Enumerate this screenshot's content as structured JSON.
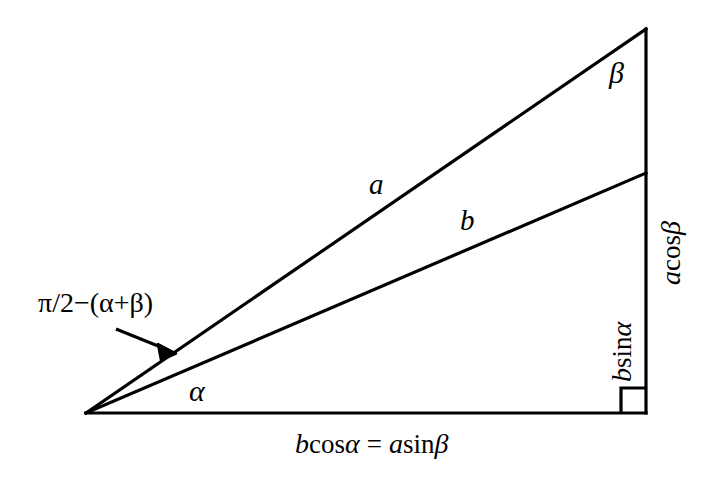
{
  "figure": {
    "background_color": "#ffffff",
    "stroke_color": "#000000",
    "width": 723,
    "height": 483
  },
  "labels": {
    "side_a": "a",
    "side_b": "b",
    "angle_alpha": "α",
    "angle_beta": "β",
    "annotation_complement": "π/2−(α+β)",
    "vertical_upper": {
      "var1": "a",
      "fn": "cos",
      "var2": "β"
    },
    "vertical_lower": {
      "var1": "b",
      "fn": "sin",
      "var2": "α"
    },
    "base_equation": {
      "lhs_var": "b",
      "lhs_fn": "cos",
      "lhs_arg": "α",
      "equals": "=",
      "rhs_var": "a",
      "rhs_fn": "sin",
      "rhs_arg": "β"
    }
  },
  "geometry": {
    "left_vertex": {
      "x": 86,
      "y": 413
    },
    "apex": {
      "x": 646,
      "y": 29
    },
    "bottom_right": {
      "x": 646,
      "y": 413
    },
    "b_endpoint": {
      "x": 646,
      "y": 173
    },
    "right_angle_marker_size": 25,
    "arrow": {
      "tail_x": 116,
      "tail_y": 329,
      "tip_x": 173,
      "tip_y": 352
    }
  }
}
